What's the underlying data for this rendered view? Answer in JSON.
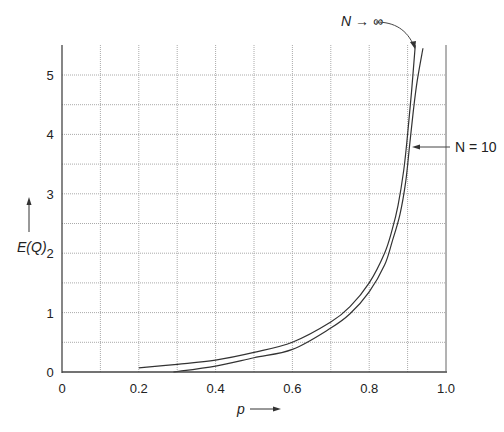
{
  "chart_data": {
    "type": "line",
    "title": "",
    "xlabel": "p",
    "ylabel": "E(Q)",
    "xlim": [
      0,
      1.0
    ],
    "ylim": [
      0,
      5.5
    ],
    "x_ticks": [
      "0",
      "0.2",
      "0.4",
      "0.6",
      "0.8",
      "1.0"
    ],
    "y_ticks": [
      "0",
      "1",
      "2",
      "3",
      "4",
      "5"
    ],
    "grid": true,
    "series": [
      {
        "name": "N → ∞",
        "x": [
          0.2,
          0.3,
          0.4,
          0.5,
          0.6,
          0.7,
          0.75,
          0.8,
          0.84,
          0.86,
          0.875,
          0.89,
          0.9,
          0.91,
          0.92
        ],
        "y": [
          0.07,
          0.13,
          0.2,
          0.33,
          0.5,
          0.84,
          1.1,
          1.5,
          2.0,
          2.4,
          2.8,
          3.4,
          4.0,
          4.7,
          5.5
        ]
      },
      {
        "name": "N = 10",
        "x": [
          0.29,
          0.4,
          0.5,
          0.6,
          0.7,
          0.75,
          0.8,
          0.84,
          0.86,
          0.88,
          0.895,
          0.905,
          0.915,
          0.925,
          0.94
        ],
        "y": [
          0.0,
          0.1,
          0.24,
          0.38,
          0.74,
          0.98,
          1.35,
          1.8,
          2.2,
          2.65,
          3.2,
          3.8,
          4.4,
          4.9,
          5.45
        ]
      }
    ],
    "annotations": [
      {
        "text": "N → ∞",
        "points_to": "upper curve near top"
      },
      {
        "text": "N = 10",
        "points_to": "lower curve near E(Q)=3.9"
      }
    ]
  },
  "labels": {
    "ylabel": "E(Q)",
    "xlabel": "p",
    "ann_inf": "N → ∞",
    "ann_10": "N = 10"
  }
}
